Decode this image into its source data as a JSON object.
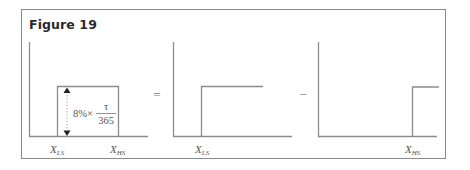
{
  "figure": {
    "title": "Figure 19",
    "colors": {
      "frame": "#8a8a8a",
      "lines": "#8c8c8c",
      "text": "#555555",
      "title": "#2a2a2a"
    }
  },
  "panels": [
    {
      "shape": "rectangular-pulse",
      "labels": {
        "x_ls": {
          "main": "X",
          "sub": "LS"
        },
        "x_hs": {
          "main": "X",
          "sub": "HS"
        }
      },
      "height_annotation": {
        "prefix": "8%×",
        "numerator": "τ",
        "denominator": "365"
      }
    },
    {
      "shape": "step-up-at-XLS",
      "labels": {
        "x_ls": {
          "main": "X",
          "sub": "LS"
        }
      }
    },
    {
      "shape": "step-up-at-XHS",
      "labels": {
        "x_hs": {
          "main": "X",
          "sub": "HS"
        }
      }
    }
  ],
  "operators": {
    "equals": "=",
    "minus": "−"
  }
}
